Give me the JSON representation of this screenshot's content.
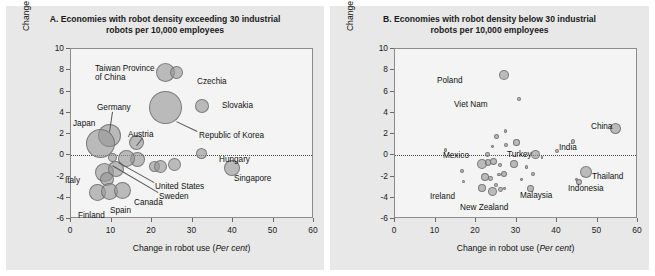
{
  "figure": {
    "background_color": "#ffffff",
    "panel_background_color": "#e8e8e8",
    "plot_background_color": "#f4f4f4",
    "bubble_color": "#969696",
    "bubble_border_color": "#6e6e6e"
  },
  "panels": {
    "a": {
      "title": "A. Economies with robot density exceeding 30 industrial robots per 10,000 employees",
      "title_line1": "A. Economies with robot density exceeding 30 industrial",
      "title_line2": "robots per 10,000 employees"
    },
    "b": {
      "title": "B. Economies with robot density below 30 industrial robots per 10,000 employees",
      "title_line1": "B. Economies with robot density below 30 industrial",
      "title_line2": "robots per 10,000 employees"
    }
  },
  "axes": {
    "xlabel_plain": "Change in robot use (",
    "xlabel_italic": "Per cent",
    "xlabel_close": ")",
    "ylabel_line1": "Change in manufacturing output share",
    "ylabel_line2": "(Percentage points)",
    "xticks": [
      "0",
      "10",
      "20",
      "30",
      "40",
      "50",
      "60"
    ],
    "yticks": [
      "10",
      "8",
      "6",
      "4",
      "2",
      "0",
      "-2",
      "-4",
      "-6"
    ]
  },
  "chart_data": [
    {
      "type": "scatter",
      "panel": "A",
      "title": "A. Economies with robot density exceeding 30 industrial robots per 10,000 employees",
      "xlabel": "Change in robot use (Per cent)",
      "ylabel": "Change in manufacturing output share (Percentage points)",
      "xlim": [
        0,
        60
      ],
      "ylim": [
        -6,
        10
      ],
      "grid": false,
      "legend": "none",
      "zero_reference_line": 0,
      "size_encoding": "bubble area ~ manufacturing output size",
      "points": [
        {
          "name": "Taiwan Province of China",
          "x": 23.4,
          "y": 7.8,
          "r": 9.5,
          "labeled": true
        },
        {
          "name": "Czechia",
          "x": 26.0,
          "y": 7.8,
          "r": 6.5,
          "labeled": true
        },
        {
          "name": "Republic of Korea",
          "x": 23.3,
          "y": 4.5,
          "r": 16.5,
          "labeled": true
        },
        {
          "name": "Slovakia",
          "x": 32.4,
          "y": 4.6,
          "r": 7.0,
          "labeled": true
        },
        {
          "name": "Germany",
          "x": 9.5,
          "y": 1.9,
          "r": 11.5,
          "labeled": true
        },
        {
          "name": "Japan",
          "x": 7.2,
          "y": 1.1,
          "r": 14.5,
          "labeled": true
        },
        {
          "name": "Austria",
          "x": 16.2,
          "y": 1.2,
          "r": 7.5,
          "labeled": true
        },
        {
          "name": "Hungary",
          "x": 32.2,
          "y": 0.2,
          "r": 5.5,
          "labeled": true
        },
        {
          "name": "Unlabeled-1",
          "x": 16.3,
          "y": -0.4,
          "r": 7.5,
          "labeled": false
        },
        {
          "name": "United States",
          "x": 13.6,
          "y": -0.3,
          "r": 8.5,
          "labeled": true
        },
        {
          "name": "Sweden",
          "x": 10.2,
          "y": -0.2,
          "r": 4.5,
          "labeled": true
        },
        {
          "name": "Unlabeled-2",
          "x": 20.6,
          "y": -1.1,
          "r": 5.5,
          "labeled": false
        },
        {
          "name": "Unlabeled-3",
          "x": 22.0,
          "y": -1.1,
          "r": 6.5,
          "labeled": false
        },
        {
          "name": "Unlabeled-4",
          "x": 25.5,
          "y": -0.9,
          "r": 6.5,
          "labeled": false
        },
        {
          "name": "Singapore",
          "x": 39.7,
          "y": -1.2,
          "r": 8.0,
          "labeled": true
        },
        {
          "name": "Italy",
          "x": 8.2,
          "y": -1.6,
          "r": 9.5,
          "labeled": true
        },
        {
          "name": "Unlabeled-5",
          "x": 11.0,
          "y": -1.3,
          "r": 8.0,
          "labeled": false
        },
        {
          "name": "Unlabeled-6",
          "x": 9.0,
          "y": -2.2,
          "r": 7.0,
          "labeled": false
        },
        {
          "name": "Finland",
          "x": 6.6,
          "y": -3.5,
          "r": 8.5,
          "labeled": true
        },
        {
          "name": "Spain",
          "x": 9.6,
          "y": -3.4,
          "r": 8.5,
          "labeled": true
        },
        {
          "name": "Canada",
          "x": 12.8,
          "y": -3.3,
          "r": 8.5,
          "labeled": true
        }
      ]
    },
    {
      "type": "scatter",
      "panel": "B",
      "title": "B. Economies with robot density below 30 industrial robots per 10,000 employees",
      "xlabel": "Change in robot use (Per cent)",
      "ylabel": "Change in manufacturing output share (Percentage points)",
      "xlim": [
        0,
        60
      ],
      "ylim": [
        -6,
        10
      ],
      "grid": false,
      "legend": "none",
      "zero_reference_line": 0,
      "size_encoding": "bubble area ~ manufacturing output size",
      "points": [
        {
          "name": "Poland",
          "x": 27.0,
          "y": 7.6,
          "r": 5.0,
          "labeled": true
        },
        {
          "name": "Viet Nam",
          "x": 30.6,
          "y": 5.3,
          "r": 2.0,
          "labeled": true
        },
        {
          "name": "China",
          "x": 54.5,
          "y": 2.5,
          "r": 5.5,
          "labeled": true
        },
        {
          "name": "Unlabeled-1",
          "x": 27.3,
          "y": 2.3,
          "r": 1.8,
          "labeled": false
        },
        {
          "name": "Unlabeled-2",
          "x": 25.0,
          "y": 1.8,
          "r": 2.5,
          "labeled": false
        },
        {
          "name": "India",
          "x": 44.0,
          "y": 1.3,
          "r": 2.2,
          "labeled": true
        },
        {
          "name": "Unlabeled-3",
          "x": 30.0,
          "y": 1.2,
          "r": 3.2,
          "labeled": false
        },
        {
          "name": "Unlabeled-4",
          "x": 27.5,
          "y": 1.0,
          "r": 2.0,
          "labeled": false
        },
        {
          "name": "Unlabeled-5",
          "x": 24.0,
          "y": 0.8,
          "r": 1.4,
          "labeled": false
        },
        {
          "name": "Unlabeled-6",
          "x": 12.5,
          "y": 0.5,
          "r": 1.8,
          "labeled": false
        },
        {
          "name": "Unlabeled-7",
          "x": 40.0,
          "y": 0.4,
          "r": 2.0,
          "labeled": false
        },
        {
          "name": "Turkey",
          "x": 34.8,
          "y": 0.05,
          "r": 4.5,
          "labeled": true
        },
        {
          "name": "Mexico",
          "x": 22.8,
          "y": 0.1,
          "r": 2.4,
          "labeled": true
        },
        {
          "name": "Unlabeled-8",
          "x": 36.3,
          "y": -0.2,
          "r": 1.4,
          "labeled": false
        },
        {
          "name": "Unlabeled-9",
          "x": 21.5,
          "y": -0.8,
          "r": 5.0,
          "labeled": false
        },
        {
          "name": "Unlabeled-10",
          "x": 23.0,
          "y": -0.7,
          "r": 3.2,
          "labeled": false
        },
        {
          "name": "Unlabeled-11",
          "x": 24.4,
          "y": -0.6,
          "r": 3.4,
          "labeled": false
        },
        {
          "name": "Unlabeled-12",
          "x": 26.0,
          "y": -0.9,
          "r": 2.2,
          "labeled": false
        },
        {
          "name": "Unlabeled-13",
          "x": 29.4,
          "y": -0.8,
          "r": 4.0,
          "labeled": false
        },
        {
          "name": "Unlabeled-14",
          "x": 32.5,
          "y": -1.1,
          "r": 1.6,
          "labeled": false
        },
        {
          "name": "Unlabeled-15",
          "x": 16.6,
          "y": -1.5,
          "r": 2.2,
          "labeled": false
        },
        {
          "name": "Thailand",
          "x": 47.2,
          "y": -1.6,
          "r": 6.0,
          "labeled": true
        },
        {
          "name": "Unlabeled-16",
          "x": 34.0,
          "y": -1.8,
          "r": 2.0,
          "labeled": false
        },
        {
          "name": "Unlabeled-17",
          "x": 27.0,
          "y": -1.8,
          "r": 3.0,
          "labeled": false
        },
        {
          "name": "Unlabeled-18",
          "x": 25.7,
          "y": -1.8,
          "r": 1.8,
          "labeled": false
        },
        {
          "name": "Unlabeled-19",
          "x": 22.1,
          "y": -2.0,
          "r": 4.0,
          "labeled": false
        },
        {
          "name": "Unlabeled-20",
          "x": 23.6,
          "y": -2.2,
          "r": 2.4,
          "labeled": false
        },
        {
          "name": "Unlabeled-21",
          "x": 31.3,
          "y": -2.3,
          "r": 1.4,
          "labeled": false
        },
        {
          "name": "Unlabeled-22",
          "x": 44.8,
          "y": -2.3,
          "r": 1.4,
          "labeled": false
        },
        {
          "name": "Unlabeled-23",
          "x": 17.0,
          "y": -2.5,
          "r": 1.6,
          "labeled": false
        },
        {
          "name": "Indonesia",
          "x": 45.5,
          "y": -2.5,
          "r": 3.0,
          "labeled": true
        },
        {
          "name": "Unlabeled-24",
          "x": 24.9,
          "y": -2.8,
          "r": 2.2,
          "labeled": false
        },
        {
          "name": "Unlabeled-25",
          "x": 27.0,
          "y": -3.1,
          "r": 1.4,
          "labeled": false
        },
        {
          "name": "Ireland",
          "x": 21.6,
          "y": -3.1,
          "r": 4.0,
          "labeled": true
        },
        {
          "name": "Malaysia",
          "x": 33.5,
          "y": -3.1,
          "r": 3.6,
          "labeled": true
        },
        {
          "name": "Unlabeled-26",
          "x": 26.0,
          "y": -3.2,
          "r": 2.4,
          "labeled": false
        },
        {
          "name": "New Zealand",
          "x": 24.1,
          "y": -3.4,
          "r": 4.5,
          "labeled": true
        }
      ]
    }
  ],
  "series_labels": {
    "a": [
      {
        "text": "Taiwan Province",
        "x": 95,
        "y": 64
      },
      {
        "text": "of China",
        "x": 95,
        "y": 73
      },
      {
        "text": "Czechia",
        "x": 197,
        "y": 77
      },
      {
        "text": "Slovakia",
        "x": 222,
        "y": 101
      },
      {
        "text": "Republic of Korea",
        "x": 199,
        "y": 131
      },
      {
        "text": "Germany",
        "x": 97,
        "y": 103
      },
      {
        "text": "Japan",
        "x": 73,
        "y": 119
      },
      {
        "text": "Austria",
        "x": 128,
        "y": 130
      },
      {
        "text": "Hungary",
        "x": 219,
        "y": 155
      },
      {
        "text": "Singapore",
        "x": 234,
        "y": 174
      },
      {
        "text": "Italy",
        "x": 65,
        "y": 176
      },
      {
        "text": "United States",
        "x": 155,
        "y": 182
      },
      {
        "text": "Sweden",
        "x": 159,
        "y": 192
      },
      {
        "text": "Canada",
        "x": 134,
        "y": 198
      },
      {
        "text": "Spain",
        "x": 110,
        "y": 206
      },
      {
        "text": "Finland",
        "x": 78,
        "y": 211
      }
    ],
    "b": [
      {
        "text": "Poland",
        "x": 437,
        "y": 76
      },
      {
        "text": "Viet Nam",
        "x": 454,
        "y": 100
      },
      {
        "text": "China",
        "x": 591,
        "y": 122
      },
      {
        "text": "India",
        "x": 559,
        "y": 143
      },
      {
        "text": "Turkey",
        "x": 507,
        "y": 150
      },
      {
        "text": "Mexico",
        "x": 443,
        "y": 151
      },
      {
        "text": "Thailand",
        "x": 592,
        "y": 172
      },
      {
        "text": "Indonesia",
        "x": 568,
        "y": 184
      },
      {
        "text": "Malaysia",
        "x": 520,
        "y": 191
      },
      {
        "text": "Ireland",
        "x": 430,
        "y": 192
      },
      {
        "text": "New Zealand",
        "x": 460,
        "y": 203
      }
    ]
  }
}
